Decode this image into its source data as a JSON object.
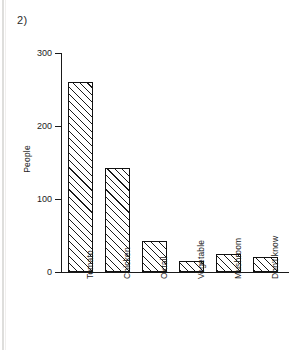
{
  "figure": {
    "number_label": "2)"
  },
  "chart_data": {
    "type": "bar",
    "title": "",
    "xlabel": "",
    "ylabel": "People",
    "categories": [
      "Tomato",
      "Chicken",
      "Oxtail",
      "Vegetable",
      "Mushroom",
      "Don't know"
    ],
    "values": [
      260,
      143,
      42,
      15,
      25,
      20
    ],
    "ylim": [
      0,
      300
    ],
    "yticks": [
      0,
      100,
      200,
      300
    ],
    "ytick_labels": [
      "0",
      "100",
      "200",
      "300"
    ],
    "grid": false,
    "legend": false,
    "bar_fill": "diagonal-hatch",
    "bar_edge_color": "#111111",
    "axis_color": "#1a1a1a"
  }
}
